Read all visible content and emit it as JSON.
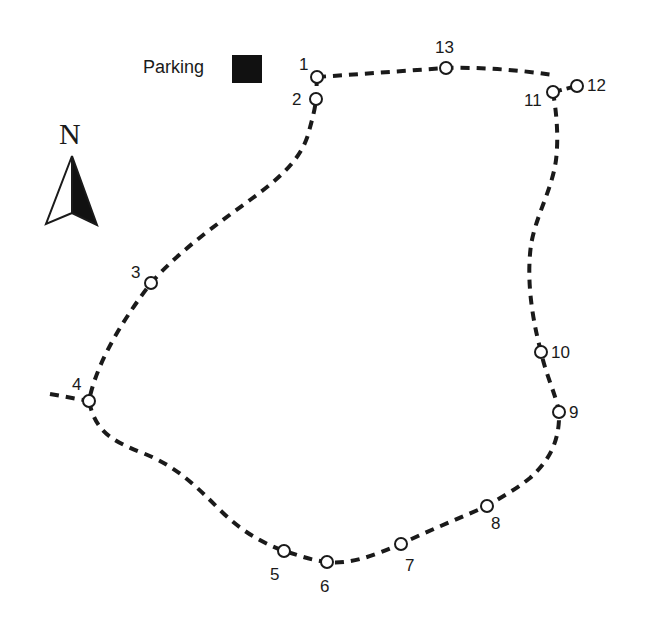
{
  "legend": {
    "parking_label": "Parking",
    "parking_color": "#111111",
    "north_label": "N"
  },
  "route": {
    "stroke_color": "#1a1a1a",
    "waypoint_fill": "#ffffff",
    "waypoints": [
      {
        "id": "1",
        "label": "1"
      },
      {
        "id": "2",
        "label": "2"
      },
      {
        "id": "3",
        "label": "3"
      },
      {
        "id": "4",
        "label": "4"
      },
      {
        "id": "5",
        "label": "5"
      },
      {
        "id": "6",
        "label": "6"
      },
      {
        "id": "7",
        "label": "7"
      },
      {
        "id": "8",
        "label": "8"
      },
      {
        "id": "9",
        "label": "9"
      },
      {
        "id": "10",
        "label": "10"
      },
      {
        "id": "11",
        "label": "11"
      },
      {
        "id": "12",
        "label": "12"
      },
      {
        "id": "13",
        "label": "13"
      }
    ]
  }
}
